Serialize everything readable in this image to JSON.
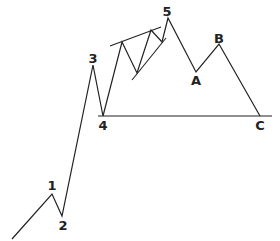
{
  "diagram": {
    "type": "elliott-wave",
    "labels": {
      "w1": "1",
      "w2": "2",
      "w3": "3",
      "w4": "4",
      "w5": "5",
      "a": "A",
      "b": "B",
      "c": "C"
    },
    "colors": {
      "line": "#222222",
      "background": "#ffffff"
    }
  }
}
